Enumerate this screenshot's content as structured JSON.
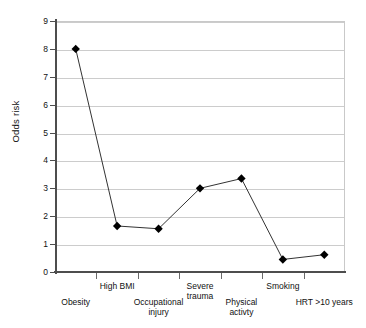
{
  "chart_data": {
    "type": "line",
    "title": "",
    "subtitle": "",
    "xlabel": "",
    "ylabel": "Odds risk",
    "categories": [
      "Obesity",
      "High BMI",
      "Occupational injury",
      "Severe trauma",
      "Physical activty",
      "Smoking",
      "HRT >10 years"
    ],
    "values": [
      8.0,
      1.65,
      1.55,
      3.0,
      3.35,
      0.45,
      0.62
    ],
    "series": [
      {
        "name": "Odds risk",
        "values": [
          8.0,
          1.65,
          1.55,
          3.0,
          3.35,
          0.45,
          0.62
        ]
      }
    ],
    "ylim": [
      0,
      9
    ],
    "ytick_labels": [
      "0",
      "1",
      "2",
      "3",
      "4",
      "5",
      "6",
      "7",
      "8",
      "9"
    ],
    "ytick_values": [
      0,
      1,
      2,
      3,
      4,
      5,
      6,
      7,
      8,
      9
    ],
    "grid": "horizontal",
    "legend": "none",
    "marker": "filled-diamond",
    "marker_color": "#000000",
    "line_color": "#333333",
    "gridline_color": "#cccccc",
    "axis_color": "#4d4d4d",
    "background": "#ffffff"
  },
  "axis": {
    "y_title": "Odds risk"
  },
  "category_labels": [
    {
      "text": "Obesity",
      "row": "bottom"
    },
    {
      "text": "High BMI",
      "row": "top"
    },
    {
      "text": "Occupational\ninjury",
      "row": "bottom"
    },
    {
      "text": "Severe\ntrauma",
      "row": "top"
    },
    {
      "text": "Physical\nactivty",
      "row": "bottom"
    },
    {
      "text": "Smoking",
      "row": "top"
    },
    {
      "text": "HRT >10 years",
      "row": "bottom"
    }
  ]
}
